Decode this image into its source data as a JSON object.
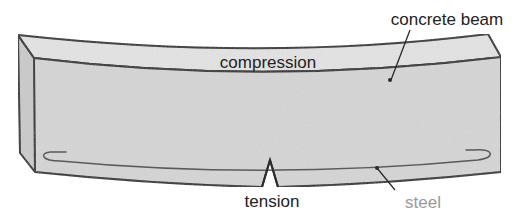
{
  "diagram": {
    "labels": {
      "compression": "compression",
      "concrete_beam": "concrete beam",
      "tension": "tension",
      "steel": "steel"
    },
    "colors": {
      "background": "#ffffff",
      "front_face": "#d6d6d6",
      "top_face": "#e4e4e4",
      "side_face": "#cbcbcb",
      "outline": "#2a2a2a",
      "steel_line": "#5a5a5a",
      "label_text": "#222222",
      "steel_label_text": "#9a9a9a"
    }
  }
}
